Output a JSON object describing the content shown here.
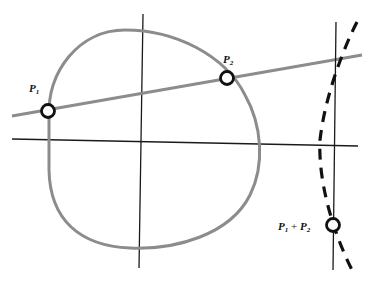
{
  "diagram": {
    "colors": {
      "curve": "#8c8c8c",
      "secant": "#8c8c8c",
      "axes": "#1a1a1a",
      "reflection_curve": "#111111",
      "point_fill": "#ffffff",
      "point_stroke": "#111111"
    },
    "points": [
      {
        "id": "p1",
        "label": "P",
        "subscript": "1"
      },
      {
        "id": "p2",
        "label": "P",
        "subscript": "2"
      },
      {
        "id": "sum",
        "label": "P",
        "subscript": "1",
        "plus": " + ",
        "label2": "P",
        "subscript2": "2"
      }
    ]
  }
}
